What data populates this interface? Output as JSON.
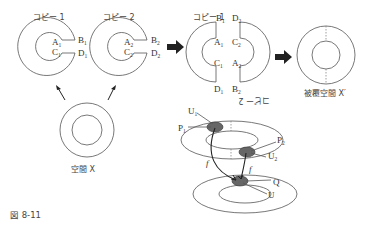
{
  "figure": {
    "caption": "図 8-11",
    "copy1_title": "コピー 1",
    "copy2_title": "コピー 2",
    "cut_copy1_title": "コピー 1",
    "cut_copy2_title_rotated": "コピー 2",
    "space_x_label": "空間 X",
    "covering_label": "被覆空間 X′",
    "copy1_points": {
      "a": "A",
      "a_sub": "1",
      "b": "B",
      "b_sub": "1",
      "c": "C",
      "c_sub": "1",
      "d": "D",
      "d_sub": "1"
    },
    "copy2_points": {
      "a": "A",
      "a_sub": "2",
      "b": "B",
      "b_sub": "2",
      "c": "C",
      "c_sub": "2",
      "d": "D",
      "d_sub": "2"
    },
    "cut_left_points": {
      "b": "B",
      "b_sub": "1",
      "a": "A",
      "a_sub": "1",
      "c": "C",
      "c_sub": "1",
      "d": "D",
      "d_sub": "1"
    },
    "cut_right_points": {
      "d": "D",
      "d_sub": "2",
      "c": "C",
      "c_sub": "2",
      "a": "A",
      "a_sub": "2",
      "b": "B",
      "b_sub": "2"
    },
    "bottom_labels": {
      "u1": "U",
      "u1_sub": "1",
      "p1": "P",
      "p1_sub": "1",
      "p2": "P",
      "p2_sub": "2",
      "u2": "U",
      "u2_sub": "2",
      "f_left": "f",
      "f_right": "f",
      "q": "Q",
      "u": "U"
    },
    "arrow_icons": [
      "right-arrow-icon",
      "right-arrow-icon",
      "up-arrow-icon",
      "up-arrow-icon"
    ]
  }
}
